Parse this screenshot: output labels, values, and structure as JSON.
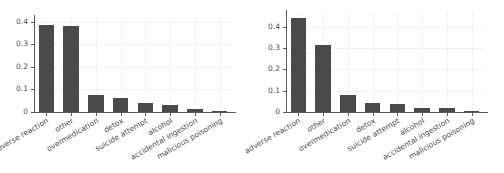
{
  "figure": {
    "background_color": "#ffffff",
    "bar_color": "#4a4a4a",
    "grid_color": "#f2f2f2",
    "axis_color": "#5b5b5b",
    "tick_label_color": "#4d4d4d"
  },
  "chart_data": [
    {
      "type": "bar",
      "title": "",
      "xlabel": "",
      "ylabel": "",
      "ylim": [
        0,
        0.42
      ],
      "yticks": [
        0,
        0.1,
        0.2,
        0.3,
        0.4
      ],
      "ytick_labels": [
        "0",
        "0.1",
        "0.2",
        "0.3",
        "0.4"
      ],
      "grid": true,
      "legend": "none",
      "categories": [
        "adverse reaction",
        "other",
        "overmedication",
        "detox",
        "suicide attempt",
        "alcohol",
        "accidental ingestion",
        "malicious poisoning"
      ],
      "values": [
        0.385,
        0.382,
        0.077,
        0.062,
        0.038,
        0.032,
        0.012,
        0.002
      ]
    },
    {
      "type": "bar",
      "title": "",
      "xlabel": "",
      "ylabel": "",
      "ylim": [
        0,
        0.47
      ],
      "yticks": [
        0,
        0.1,
        0.2,
        0.3,
        0.4
      ],
      "ytick_labels": [
        "0",
        "0.1",
        "0.2",
        "0.3",
        "0.4"
      ],
      "grid": true,
      "legend": "none",
      "categories": [
        "adverse reaction",
        "other",
        "overmedication",
        "detox",
        "suicide attempt",
        "alcohol",
        "accidental ingestion",
        "malicious poisoning"
      ],
      "values": [
        0.443,
        0.315,
        0.082,
        0.044,
        0.04,
        0.02,
        0.02,
        0.002
      ]
    }
  ]
}
